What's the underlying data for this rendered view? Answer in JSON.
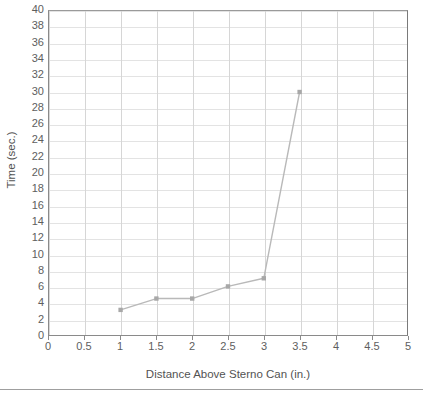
{
  "chart_data": {
    "type": "line",
    "title": "",
    "xlabel": "Distance Above Sterno Can (in.)",
    "ylabel": "Time (sec.)",
    "x": [
      1,
      1.5,
      2,
      2.5,
      3,
      3.5
    ],
    "values": [
      3.1,
      4.5,
      4.5,
      6.0,
      7.0,
      30.0
    ],
    "series": [
      {
        "name": "Time vs Distance",
        "x": [
          1,
          1.5,
          2,
          2.5,
          3,
          3.5
        ],
        "values": [
          3.1,
          4.5,
          4.5,
          6.0,
          7.0,
          30.0
        ]
      }
    ],
    "xlim": [
      0,
      5
    ],
    "ylim": [
      0,
      40
    ],
    "xticks": [
      0,
      0.5,
      1,
      1.5,
      2,
      2.5,
      3,
      3.5,
      4,
      4.5,
      5
    ],
    "yticks": [
      0,
      2,
      4,
      6,
      8,
      10,
      12,
      14,
      16,
      18,
      20,
      22,
      24,
      26,
      28,
      30,
      32,
      34,
      36,
      38,
      40
    ],
    "xtick_labels": [
      "0",
      "0.5",
      "1",
      "1.5",
      "2",
      "2.5",
      "3",
      "3.5",
      "4",
      "4.5",
      "5"
    ],
    "ytick_labels": [
      "0",
      "2",
      "4",
      "6",
      "8",
      "10",
      "12",
      "14",
      "16",
      "18",
      "20",
      "22",
      "24",
      "26",
      "28",
      "30",
      "32",
      "34",
      "36",
      "38",
      "40"
    ],
    "grid": true,
    "legend": false,
    "legend_position": "none",
    "marker": "square",
    "line_color": "#b9b9b9",
    "marker_color": "#a8a8a8",
    "grid_color_horizontal": "#e3e3e3",
    "grid_color_vertical": "#d6d6d6",
    "axis_color": "#8a8a8a",
    "text_color": "#5e5e5e",
    "background": "#ffffff"
  }
}
